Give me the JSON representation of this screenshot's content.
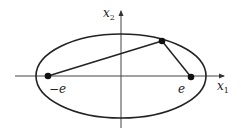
{
  "figure": {
    "width": 241,
    "height": 131,
    "stroke_color": "#222222",
    "axis_color": "#444444",
    "axes": {
      "x_label": "x",
      "x_subscript": "1",
      "y_label": "x",
      "y_subscript": "2",
      "origin": [
        121,
        76
      ],
      "x_range_px": [
        15,
        225
      ],
      "y_range_px": [
        10,
        128
      ]
    },
    "ellipse": {
      "cx": 121,
      "cy": 76,
      "rx": 85,
      "ry": 42
    },
    "foci": [
      {
        "name": "left-focus",
        "x": 48,
        "y": 76,
        "label": "−e"
      },
      {
        "name": "right-focus",
        "x": 191,
        "y": 77,
        "label": "e"
      }
    ],
    "point_on_ellipse": {
      "x": 162,
      "y": 41
    },
    "segments": [
      {
        "from": "left-focus",
        "to": "point_on_ellipse"
      },
      {
        "from": "point_on_ellipse",
        "to": "right-focus"
      }
    ]
  }
}
